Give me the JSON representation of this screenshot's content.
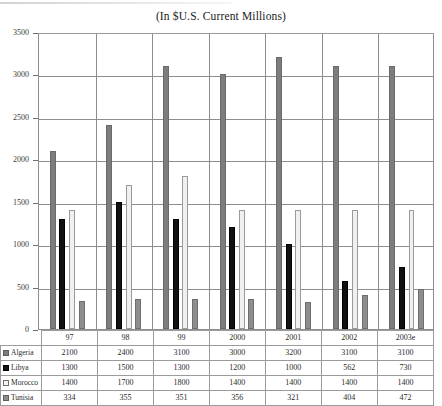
{
  "chart_data": {
    "type": "bar",
    "title": "(In $U.S. Current Millions)",
    "xlabel": "",
    "ylabel": "",
    "ylim": [
      0,
      3500
    ],
    "ytick_values": [
      0,
      500,
      1000,
      1500,
      2000,
      2500,
      3000,
      3500
    ],
    "ytick_labels": [
      "0",
      "500",
      "1000",
      "1500",
      "2000",
      "2500",
      "3000",
      "3500"
    ],
    "grid": true,
    "legend_position": "table-row-labels",
    "categories": [
      "97",
      "98",
      "99",
      "2000",
      "2001",
      "2002",
      "2003e"
    ],
    "series": [
      {
        "name": "Algeria",
        "color": "#7d7d7d",
        "values": [
          2100,
          2400,
          3100,
          3000,
          3200,
          3100,
          3100
        ]
      },
      {
        "name": "Libya",
        "color": "#111111",
        "values": [
          1300,
          1500,
          1300,
          1200,
          1000,
          562,
          730
        ]
      },
      {
        "name": "Morocco",
        "color": "#f0f0f0",
        "values": [
          1400,
          1700,
          1800,
          1400,
          1400,
          1400,
          1400
        ]
      },
      {
        "name": "Tunisia",
        "color": "#8d8d8d",
        "values": [
          334,
          355,
          351,
          356,
          321,
          404,
          472
        ]
      }
    ]
  },
  "table": {
    "corner_label": "",
    "column_headers": [
      "97",
      "98",
      "99",
      "2000",
      "2001",
      "2002",
      "2003e"
    ],
    "rows": [
      {
        "label": "Algeria",
        "swatch": "series-swatch-algeria",
        "values": [
          "2100",
          "2400",
          "3100",
          "3000",
          "3200",
          "3100",
          "3100"
        ]
      },
      {
        "label": "Libya",
        "swatch": "series-swatch-libya",
        "values": [
          "1300",
          "1500",
          "1300",
          "1200",
          "1000",
          "562",
          "730"
        ]
      },
      {
        "label": "Morocco",
        "swatch": "series-swatch-morocco",
        "values": [
          "1400",
          "1700",
          "1800",
          "1400",
          "1400",
          "1400",
          "1400"
        ]
      },
      {
        "label": "Tunisia",
        "swatch": "series-swatch-tunisia",
        "values": [
          "334",
          "355",
          "351",
          "356",
          "321",
          "404",
          "472"
        ]
      }
    ]
  },
  "colors": {
    "algeria": "#7d7d7d",
    "libya": "#111111",
    "morocco": "#f0f0f0",
    "tunisia": "#8d8d8d",
    "axis": "#8e8e8e",
    "text": "#2a2a2a"
  }
}
